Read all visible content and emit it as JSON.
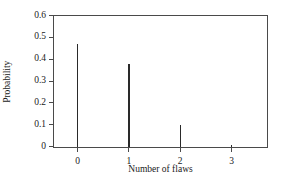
{
  "chart_data": {
    "type": "bar",
    "title": "",
    "subtitle": "",
    "xlabel": "Number of flaws",
    "ylabel": "Probability",
    "categories": [
      "0",
      "1",
      "2",
      "3"
    ],
    "x": [
      0,
      1,
      2,
      3
    ],
    "values": [
      0.47,
      0.38,
      0.1,
      0.01
    ],
    "xlim": [
      -0.45,
      3.7
    ],
    "ylim": [
      0,
      0.6
    ],
    "xticks": [
      0,
      1,
      2,
      3
    ],
    "xtick_labels": [
      "0",
      "1",
      "2",
      "3"
    ],
    "yticks": [
      0,
      0.1,
      0.2,
      0.3,
      0.4,
      0.5,
      0.6
    ],
    "ytick_labels": [
      "0",
      "0.1",
      "0.2",
      "0.3",
      "0.4",
      "0.5",
      "0.6"
    ],
    "grid": false,
    "legend": false,
    "legend_position": "none",
    "series": [
      {
        "name": "Probability",
        "values": [
          0.47,
          0.38,
          0.1,
          0.01
        ],
        "color": "#2a2a2a"
      }
    ],
    "annotations": [],
    "colors": {
      "spike": "#2a2a2a",
      "axis": "#4a4a4a",
      "background": "#ffffff",
      "text": "#1a1a1a"
    }
  }
}
